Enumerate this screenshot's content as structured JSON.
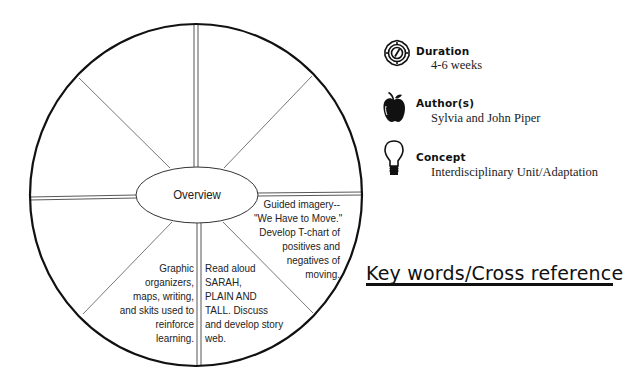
{
  "wheel": {
    "center_label": "Overview",
    "segments": [
      {
        "position": "top-left-upper",
        "text_lines": []
      },
      {
        "position": "top-right-upper",
        "text_lines": []
      },
      {
        "position": "right-upper",
        "text_lines": []
      },
      {
        "position": "right-lower",
        "text_lines": [
          "Guided imagery--",
          "\"We Have to Move.\"",
          "Develop T-chart of",
          "positives and",
          "negatives of",
          "moving."
        ]
      },
      {
        "position": "bottom-right",
        "text_lines": [
          "Read aloud",
          "SARAH,",
          "PLAIN AND",
          "TALL.  Discuss",
          "and develop story",
          "web."
        ]
      },
      {
        "position": "bottom-left",
        "text_lines": [
          "Graphic",
          "organizers,",
          "maps, writing,",
          "and skits used to",
          "reinforce",
          "learning."
        ]
      },
      {
        "position": "left-lower",
        "text_lines": []
      },
      {
        "position": "left-upper",
        "text_lines": []
      }
    ]
  },
  "info": {
    "duration": {
      "icon": "compass-clock-icon",
      "title": "Duration",
      "value": "4-6 weeks"
    },
    "authors": {
      "icon": "apple-icon",
      "title": "Author(s)",
      "value": "Sylvia and John Piper"
    },
    "concept": {
      "icon": "lightbulb-icon",
      "title": "Concept",
      "value": "Interdisciplinary Unit/Adaptation"
    }
  },
  "keywords": {
    "heading": "Key words/Cross reference"
  }
}
